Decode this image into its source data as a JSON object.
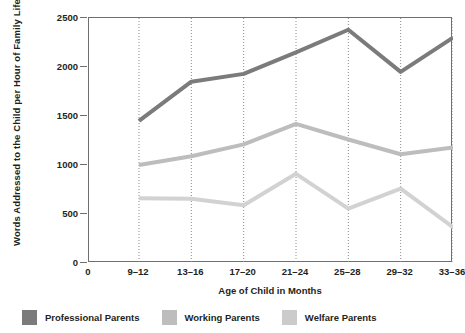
{
  "chart_data": {
    "type": "line",
    "title": "",
    "xlabel": "Age of Child in Months",
    "ylabel": "Words Addressed to the Child per Hour of Family Life",
    "categories": [
      "9–12",
      "13–16",
      "17–20",
      "21–24",
      "25–28",
      "29–32",
      "33–36"
    ],
    "xtick_labels": [
      "0",
      "9–12",
      "13–16",
      "17–20",
      "21–24",
      "25–28",
      "29–32",
      "33–36"
    ],
    "ytick_labels": [
      "0",
      "500",
      "1000",
      "1500",
      "2000",
      "2500"
    ],
    "yticks": [
      0,
      500,
      1000,
      1500,
      2000,
      2500
    ],
    "ylim": [
      0,
      2500
    ],
    "grid": "vertical-dotted",
    "legend_position": "bottom-left",
    "series": [
      {
        "name": "Professional Parents",
        "color": "#7b7b7b",
        "values": [
          1450,
          1850,
          1930,
          2150,
          2380,
          1950,
          2300
        ]
      },
      {
        "name": "Working Parents",
        "color": "#bdbdbd",
        "values": [
          1000,
          1090,
          1210,
          1420,
          1260,
          1110,
          1180
        ]
      },
      {
        "name": "Welfare Parents",
        "color": "#d2d2d2",
        "values": [
          660,
          655,
          590,
          910,
          555,
          760,
          365
        ]
      }
    ]
  },
  "legend": {
    "items": [
      {
        "label": "Professional Parents",
        "color": "#7b7b7b"
      },
      {
        "label": "Working Parents",
        "color": "#bdbdbd"
      },
      {
        "label": "Welfare Parents",
        "color": "#cbcbcb"
      }
    ]
  },
  "axes": {
    "frame_color": "#6f6f6f",
    "gridline_color": "#8a8a8a"
  }
}
